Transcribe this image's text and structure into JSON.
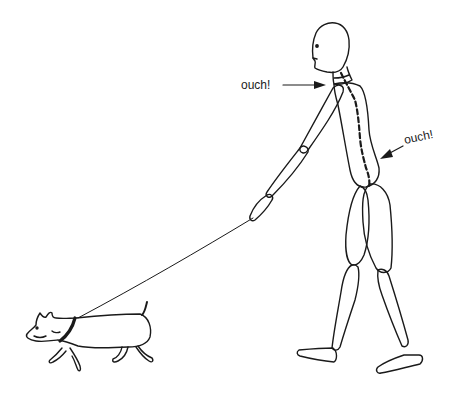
{
  "illustration": {
    "subject": "Person walking a dog on a leash with back pain",
    "labels": {
      "neck_pain": "ouch!",
      "lower_back_pain": "ouch!"
    },
    "colors": {
      "stroke": "#1a1a1a",
      "background": "#ffffff"
    }
  }
}
